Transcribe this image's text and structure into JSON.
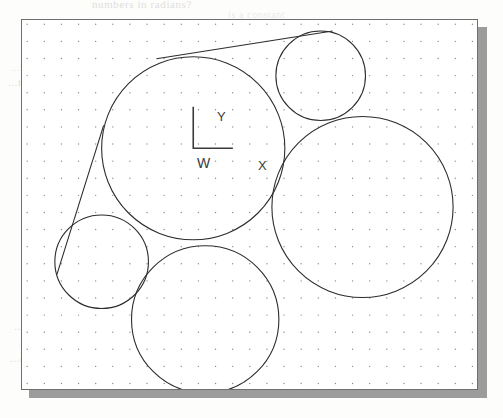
{
  "page": {
    "background_color": "#fdfdfc",
    "bleed_through_text": [
      {
        "text": "numbers in radians?",
        "x": 92,
        "y": -2,
        "size": 11
      },
      {
        "text": "is a constant",
        "x": 228,
        "y": 9,
        "size": 10
      },
      {
        "text": "...a tangent to a circle",
        "x": 56,
        "y": 47,
        "size": 11
      },
      {
        "text": "...variant count and scan it until",
        "x": 10,
        "y": 61,
        "size": 11
      },
      {
        "text": "...the selected object's address",
        "x": 8,
        "y": 76,
        "size": 11
      },
      {
        "text": "...in the circle, which is the",
        "x": 28,
        "y": 304,
        "size": 11
      },
      {
        "text": "...move these lines. We change the center...",
        "x": 14,
        "y": 320,
        "size": 11
      },
      {
        "text": "...can't handle the setting, select the",
        "x": 18,
        "y": 336,
        "size": 11
      },
      {
        "text": "...can't even draw the circle it's offset by",
        "x": 10,
        "y": 352,
        "size": 11
      }
    ]
  },
  "figure": {
    "name": "cad-viewport",
    "frame": {
      "x": 21,
      "y": 19,
      "width": 457,
      "height": 371
    },
    "border_color": "#6f6f6f",
    "shadow_color": "#9c9c9c",
    "background_color": "#ffffff",
    "grid": {
      "visible": true,
      "type": "dot",
      "spacing_px": 17.2,
      "origin_x": 21,
      "origin_y": 19,
      "dot_color": "#8c8c8c",
      "dot_radius": 0.7
    },
    "line_color": "#2d2d2d",
    "line_width": 1.1,
    "circles": [
      {
        "name": "circle-center-large",
        "cx": 193,
        "cy": 148,
        "r": 92
      },
      {
        "name": "circle-top-right",
        "cx": 321,
        "cy": 75,
        "r": 45
      },
      {
        "name": "circle-right-large",
        "cx": 363,
        "cy": 207,
        "r": 91
      },
      {
        "name": "circle-bottom",
        "cx": 205,
        "cy": 320,
        "r": 74
      },
      {
        "name": "circle-left-small",
        "cx": 101,
        "cy": 262,
        "r": 47
      }
    ],
    "tangent_lines": [
      {
        "name": "tangent-top",
        "x1": 156,
        "y1": 58,
        "x2": 333,
        "y2": 30
      },
      {
        "name": "tangent-left",
        "x1": 103,
        "y1": 125,
        "x2": 56,
        "y2": 275
      }
    ]
  },
  "wcs_icon": {
    "name": "wcs-axis-icon",
    "origin_x": 193,
    "origin_y": 148,
    "y_axis_tip_y": 107,
    "x_axis_tip_x": 232,
    "label_y": "Y",
    "label_x": "X",
    "label_w": "W",
    "color": "#3b3b3b"
  }
}
